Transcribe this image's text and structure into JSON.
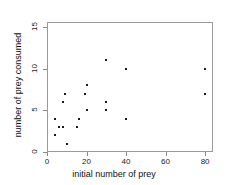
{
  "chart_data": {
    "type": "scatter",
    "title": "",
    "xlabel": "initial number of prey",
    "ylabel": "number of prey consumed",
    "xlim": [
      0,
      84
    ],
    "ylim": [
      0,
      15.6
    ],
    "xticks": [
      0,
      20,
      40,
      60,
      80
    ],
    "yticks": [
      0,
      5,
      10,
      15
    ],
    "xtick_labels": [
      "0",
      "20",
      "40",
      "60",
      "80"
    ],
    "ytick_labels": [
      "0",
      "5",
      "10",
      "15"
    ],
    "grid": false,
    "legend": null,
    "marker": "filled-square",
    "marker_color": "#1a1a1a",
    "frame_color": "#9a9a9a",
    "x": [
      4,
      4,
      6,
      8,
      8,
      9,
      10,
      15,
      16,
      19,
      20,
      20,
      30,
      30,
      30,
      40,
      40,
      80,
      80
    ],
    "y": [
      4,
      2,
      3,
      3,
      6,
      7,
      1,
      3,
      4,
      7,
      8,
      5,
      11,
      6,
      5,
      10,
      4,
      10,
      7
    ],
    "points": [
      {
        "x": 4,
        "y": 4
      },
      {
        "x": 4,
        "y": 2
      },
      {
        "x": 6,
        "y": 3
      },
      {
        "x": 8,
        "y": 3
      },
      {
        "x": 8,
        "y": 6
      },
      {
        "x": 9,
        "y": 7
      },
      {
        "x": 10,
        "y": 1
      },
      {
        "x": 15,
        "y": 3
      },
      {
        "x": 16,
        "y": 4
      },
      {
        "x": 19,
        "y": 7
      },
      {
        "x": 20,
        "y": 8
      },
      {
        "x": 20,
        "y": 5
      },
      {
        "x": 30,
        "y": 11
      },
      {
        "x": 30,
        "y": 6
      },
      {
        "x": 30,
        "y": 5
      },
      {
        "x": 40,
        "y": 10
      },
      {
        "x": 40,
        "y": 4
      },
      {
        "x": 80,
        "y": 10
      },
      {
        "x": 80,
        "y": 7
      }
    ]
  }
}
